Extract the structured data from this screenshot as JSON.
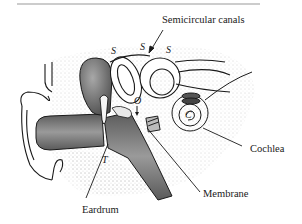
{
  "diagram": {
    "labels": {
      "semicircular_canals": "Semicircular canals",
      "cochlea": "Cochlea",
      "membrane": "Membrane",
      "eardrum": "Eardrum"
    },
    "letters": {
      "s1": "S",
      "s2": "S",
      "s3": "S",
      "o": "O",
      "c": "C",
      "t": "T"
    },
    "colors": {
      "ink": "#1a1a1a",
      "canal_fill": "#8a8a8a",
      "canal_dark": "#5a5a5a",
      "stipple": "#c8c8c8",
      "rule": "#9a9a9a"
    }
  }
}
